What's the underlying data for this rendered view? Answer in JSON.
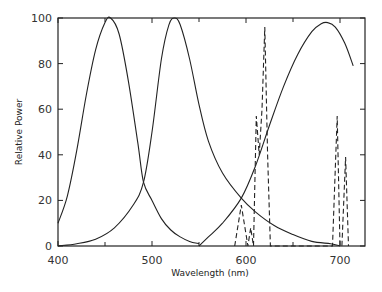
{
  "chart_data": {
    "type": "line",
    "title": "",
    "xlabel": "Wavelength (nm)",
    "ylabel": "Relative Power",
    "xlim": [
      400,
      725
    ],
    "ylim": [
      0,
      100
    ],
    "xticks_major": [
      400,
      500,
      600,
      700
    ],
    "xticks_minor": [
      450,
      550,
      650
    ],
    "yticks": [
      0,
      20,
      40,
      60,
      80,
      100
    ],
    "grid": false,
    "legend": null,
    "series": [
      {
        "name": "Blue primary",
        "style": "solid",
        "x": [
          400,
          410,
          420,
          430,
          440,
          450,
          456,
          465,
          475,
          485,
          491,
          500,
          510,
          520,
          530,
          540,
          550
        ],
        "y": [
          10,
          22,
          42,
          66,
          86,
          98,
          100,
          93,
          72,
          45,
          28,
          20,
          12,
          7,
          4,
          2,
          1
        ]
      },
      {
        "name": "Green primary",
        "style": "solid",
        "x": [
          400,
          420,
          440,
          460,
          480,
          491,
          500,
          510,
          518,
          524,
          530,
          540,
          550,
          560,
          575,
          595,
          610,
          630,
          650,
          670,
          690,
          700
        ],
        "y": [
          0,
          1,
          3,
          8,
          18,
          28,
          50,
          82,
          97,
          100,
          97,
          82,
          62,
          46,
          32,
          21,
          15,
          9,
          5,
          2,
          1,
          0
        ]
      },
      {
        "name": "Red primary",
        "style": "solid",
        "x": [
          550,
          560,
          575,
          595,
          610,
          625,
          640,
          655,
          670,
          680,
          687,
          695,
          705,
          714
        ],
        "y": [
          0,
          4,
          10,
          21,
          35,
          53,
          70,
          84,
          94,
          97.5,
          98,
          96,
          89,
          79
        ]
      },
      {
        "name": "Phosphor line spectrum",
        "style": "dashed",
        "x": [
          588,
          595,
          602,
          605,
          608,
          611,
          614,
          617,
          620,
          623,
          626,
          692,
          697,
          700,
          702,
          706,
          709
        ],
        "y": [
          0,
          18,
          0,
          8,
          0,
          57,
          40,
          60,
          96,
          40,
          0,
          0,
          57,
          0,
          0,
          39,
          0
        ]
      }
    ]
  }
}
